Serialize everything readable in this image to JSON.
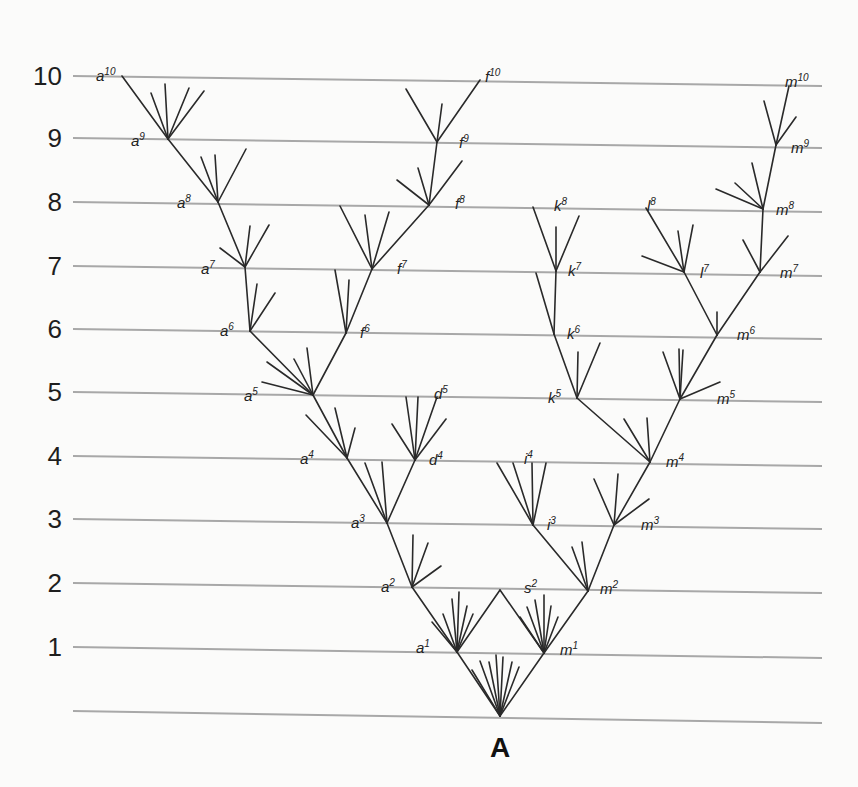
{
  "diagram": {
    "ancestor_label": "A",
    "generations": [
      {
        "label": "10",
        "y_left": 76,
        "y_right": 86
      },
      {
        "label": "9",
        "y_left": 138,
        "y_right": 148
      },
      {
        "label": "8",
        "y_left": 202,
        "y_right": 212
      },
      {
        "label": "7",
        "y_left": 266,
        "y_right": 276
      },
      {
        "label": "6",
        "y_left": 329,
        "y_right": 339
      },
      {
        "label": "5",
        "y_left": 392,
        "y_right": 402
      },
      {
        "label": "4",
        "y_left": 456,
        "y_right": 466
      },
      {
        "label": "3",
        "y_left": 519,
        "y_right": 529
      },
      {
        "label": "2",
        "y_left": 583,
        "y_right": 593
      },
      {
        "label": "1",
        "y_left": 647,
        "y_right": 658
      },
      {
        "label": "",
        "y_left": 711,
        "y_right": 723
      }
    ],
    "line_x_start": 73,
    "line_x_end": 822,
    "colors": {
      "background": "#fbfbfa",
      "generation_line": "#a8a8a8",
      "branch": "#2a2a2a",
      "text": "#1e1e1e"
    },
    "nodes": [
      {
        "id": "A",
        "x": 500,
        "y": 716
      },
      {
        "id": "a1",
        "x": 457,
        "y": 652,
        "base": "a",
        "sup": "1",
        "lx": 416,
        "ly": 641
      },
      {
        "id": "m1",
        "x": 544,
        "y": 653,
        "base": "m",
        "sup": "1",
        "lx": 560,
        "ly": 643
      },
      {
        "id": "s2",
        "x": 500,
        "y": 590,
        "base": "s",
        "sup": "2",
        "lx": 524,
        "ly": 581
      },
      {
        "id": "a2",
        "x": 412,
        "y": 587,
        "base": "a",
        "sup": "2",
        "lx": 381,
        "ly": 580
      },
      {
        "id": "m2",
        "x": 588,
        "y": 591,
        "base": "m",
        "sup": "2",
        "lx": 600,
        "ly": 582
      },
      {
        "id": "a3",
        "x": 387,
        "y": 523,
        "base": "a",
        "sup": "3",
        "lx": 351,
        "ly": 516
      },
      {
        "id": "i3",
        "x": 533,
        "y": 525,
        "base": "i",
        "sup": "3",
        "lx": 547,
        "ly": 518
      },
      {
        "id": "m3",
        "x": 614,
        "y": 525,
        "base": "m",
        "sup": "3",
        "lx": 641,
        "ly": 518
      },
      {
        "id": "a4",
        "x": 347,
        "y": 458,
        "base": "a",
        "sup": "4",
        "lx": 300,
        "ly": 452
      },
      {
        "id": "d4",
        "x": 415,
        "y": 460,
        "base": "d",
        "sup": "4",
        "lx": 429,
        "ly": 453
      },
      {
        "id": "i4",
        "x": 528,
        "y": 462,
        "base": "i",
        "sup": "4",
        "lx": 524,
        "ly": 452
      },
      {
        "id": "m4",
        "x": 650,
        "y": 462,
        "base": "m",
        "sup": "4",
        "lx": 666,
        "ly": 455
      },
      {
        "id": "a5",
        "x": 313,
        "y": 395,
        "base": "a",
        "sup": "5",
        "lx": 244,
        "ly": 389
      },
      {
        "id": "d5",
        "x": 437,
        "y": 397,
        "base": "d",
        "sup": "5",
        "lx": 434,
        "ly": 387
      },
      {
        "id": "k5",
        "x": 577,
        "y": 398,
        "base": "k",
        "sup": "5",
        "lx": 548,
        "ly": 391
      },
      {
        "id": "m5",
        "x": 680,
        "y": 399,
        "base": "m",
        "sup": "5",
        "lx": 717,
        "ly": 392
      },
      {
        "id": "a6",
        "x": 250,
        "y": 331,
        "base": "a",
        "sup": "6",
        "lx": 220,
        "ly": 324
      },
      {
        "id": "f6",
        "x": 346,
        "y": 333,
        "base": "f",
        "sup": "6",
        "lx": 360,
        "ly": 326
      },
      {
        "id": "k6",
        "x": 554,
        "y": 334,
        "base": "k",
        "sup": "6",
        "lx": 567,
        "ly": 327
      },
      {
        "id": "m6",
        "x": 717,
        "y": 335,
        "base": "m",
        "sup": "6",
        "lx": 737,
        "ly": 328
      },
      {
        "id": "a7",
        "x": 245,
        "y": 267,
        "base": "a",
        "sup": "7",
        "lx": 201,
        "ly": 262
      },
      {
        "id": "f7",
        "x": 372,
        "y": 269,
        "base": "f",
        "sup": "7",
        "lx": 397,
        "ly": 262
      },
      {
        "id": "k7",
        "x": 556,
        "y": 271,
        "base": "k",
        "sup": "7",
        "lx": 568,
        "ly": 264
      },
      {
        "id": "l7",
        "x": 684,
        "y": 272,
        "base": "l",
        "sup": "7",
        "lx": 700,
        "ly": 266
      },
      {
        "id": "m7",
        "x": 760,
        "y": 272,
        "base": "m",
        "sup": "7",
        "lx": 780,
        "ly": 266
      },
      {
        "id": "a8",
        "x": 218,
        "y": 202,
        "base": "a",
        "sup": "8",
        "lx": 177,
        "ly": 196
      },
      {
        "id": "f8",
        "x": 429,
        "y": 205,
        "base": "f",
        "sup": "8",
        "lx": 455,
        "ly": 197
      },
      {
        "id": "k8",
        "x": 533,
        "y": 207,
        "base": "k",
        "sup": "8",
        "lx": 554,
        "ly": 199
      },
      {
        "id": "l8",
        "x": 646,
        "y": 208,
        "base": "l",
        "sup": "8",
        "lx": 647,
        "ly": 199
      },
      {
        "id": "m8",
        "x": 763,
        "y": 209,
        "base": "m",
        "sup": "8",
        "lx": 776,
        "ly": 203
      },
      {
        "id": "a9",
        "x": 168,
        "y": 139,
        "base": "a",
        "sup": "9",
        "lx": 131,
        "ly": 134
      },
      {
        "id": "f9",
        "x": 437,
        "y": 142,
        "base": "f",
        "sup": "9",
        "lx": 459,
        "ly": 136
      },
      {
        "id": "m9",
        "x": 776,
        "y": 145,
        "base": "m",
        "sup": "9",
        "lx": 791,
        "ly": 141
      },
      {
        "id": "a10",
        "x": 122,
        "y": 76,
        "base": "a",
        "sup": "10",
        "lx": 96,
        "ly": 69
      },
      {
        "id": "f10",
        "x": 480,
        "y": 80,
        "base": "f",
        "sup": "10",
        "lx": 485,
        "ly": 70
      },
      {
        "id": "m10",
        "x": 789,
        "y": 86,
        "base": "m",
        "sup": "10",
        "lx": 785,
        "ly": 75
      }
    ],
    "edges": [
      [
        "A",
        "a1"
      ],
      [
        "A",
        "m1"
      ],
      [
        "a1",
        "a2"
      ],
      [
        "a1",
        "s2"
      ],
      [
        "m1",
        "s2"
      ],
      [
        "m1",
        "m2"
      ],
      [
        "a2",
        "a3"
      ],
      [
        "m2",
        "i3"
      ],
      [
        "m2",
        "m3"
      ],
      [
        "a3",
        "a4"
      ],
      [
        "a3",
        "d4"
      ],
      [
        "m3",
        "m4"
      ],
      [
        "a4",
        "a5"
      ],
      [
        "d4",
        "d5"
      ],
      [
        "m4",
        "k5"
      ],
      [
        "m4",
        "m5"
      ],
      [
        "a5",
        "a6"
      ],
      [
        "a5",
        "f6"
      ],
      [
        "k5",
        "k6"
      ],
      [
        "m5",
        "m6"
      ],
      [
        "a6",
        "a7"
      ],
      [
        "f6",
        "f7"
      ],
      [
        "k6",
        "k7"
      ],
      [
        "m6",
        "l7"
      ],
      [
        "m6",
        "m7"
      ],
      [
        "a7",
        "a8"
      ],
      [
        "f7",
        "f8"
      ],
      [
        "k7",
        "k8"
      ],
      [
        "l7",
        "l8"
      ],
      [
        "m7",
        "m8"
      ],
      [
        "a8",
        "a9"
      ],
      [
        "f8",
        "f9"
      ],
      [
        "m8",
        "m9"
      ],
      [
        "a9",
        "a10"
      ],
      [
        "f9",
        "f10"
      ],
      [
        "m9",
        "m10"
      ]
    ],
    "extinct_twigs": [
      {
        "from": "A",
        "to": [
          [
            472,
            670
          ],
          [
            480,
            661
          ],
          [
            489,
            662
          ],
          [
            496,
            655
          ],
          [
            503,
            657
          ],
          [
            512,
            662
          ],
          [
            519,
            667
          ]
        ]
      },
      {
        "from": "a1",
        "to": [
          [
            432,
            622
          ],
          [
            443,
            614
          ],
          [
            452,
            599
          ],
          [
            459,
            592
          ],
          [
            467,
            606
          ],
          [
            473,
            614
          ]
        ]
      },
      {
        "from": "m1",
        "to": [
          [
            520,
            617
          ],
          [
            527,
            607
          ],
          [
            535,
            600
          ],
          [
            544,
            595
          ],
          [
            551,
            606
          ],
          [
            558,
            617
          ]
        ]
      },
      {
        "from": "a2",
        "to": [
          [
            413,
            535
          ],
          [
            428,
            543
          ],
          [
            441,
            566
          ]
        ]
      },
      {
        "from": "m2",
        "to": [
          [
            572,
            547
          ],
          [
            582,
            542
          ]
        ]
      },
      {
        "from": "a3",
        "to": [
          [
            365,
            463
          ],
          [
            382,
            462
          ]
        ]
      },
      {
        "from": "i3",
        "to": [
          [
            497,
            463
          ],
          [
            513,
            463
          ],
          [
            532,
            463
          ],
          [
            546,
            463
          ]
        ]
      },
      {
        "from": "m3",
        "to": [
          [
            594,
            479
          ],
          [
            618,
            474
          ],
          [
            649,
            499
          ]
        ]
      },
      {
        "from": "a4",
        "to": [
          [
            306,
            415
          ],
          [
            335,
            408
          ],
          [
            355,
            428
          ]
        ]
      },
      {
        "from": "d4",
        "to": [
          [
            392,
            424
          ],
          [
            406,
            397
          ],
          [
            418,
            397
          ],
          [
            446,
            419
          ]
        ]
      },
      {
        "from": "m4",
        "to": [
          [
            624,
            419
          ],
          [
            647,
            418
          ]
        ]
      },
      {
        "from": "a5",
        "to": [
          [
            267,
            362
          ],
          [
            262,
            382
          ],
          [
            294,
            359
          ],
          [
            307,
            348
          ]
        ]
      },
      {
        "from": "k5",
        "to": [
          [
            578,
            352
          ],
          [
            600,
            343
          ]
        ]
      },
      {
        "from": "m5",
        "to": [
          [
            663,
            352
          ],
          [
            679,
            349
          ],
          [
            683,
            350
          ],
          [
            720,
            382
          ]
        ]
      },
      {
        "from": "m6",
        "to": [
          [
            717,
            312
          ]
        ]
      },
      {
        "from": "a6",
        "to": [
          [
            257,
            284
          ],
          [
            275,
            293
          ]
        ]
      },
      {
        "from": "f6",
        "to": [
          [
            335,
            270
          ],
          [
            349,
            280
          ]
        ]
      },
      {
        "from": "k6",
        "to": [
          [
            536,
            273
          ]
        ]
      },
      {
        "from": "a7",
        "to": [
          [
            220,
            248
          ],
          [
            250,
            226
          ],
          [
            269,
            225
          ]
        ]
      },
      {
        "from": "f7",
        "to": [
          [
            340,
            206
          ],
          [
            365,
            215
          ],
          [
            389,
            212
          ]
        ]
      },
      {
        "from": "k7",
        "to": [
          [
            556,
            227
          ],
          [
            579,
            216
          ]
        ]
      },
      {
        "from": "l7",
        "to": [
          [
            642,
            256
          ],
          [
            678,
            231
          ],
          [
            693,
            225
          ]
        ]
      },
      {
        "from": "m7",
        "to": [
          [
            743,
            240
          ],
          [
            788,
            236
          ]
        ]
      },
      {
        "from": "a8",
        "to": [
          [
            201,
            157
          ],
          [
            215,
            155
          ],
          [
            246,
            149
          ]
        ]
      },
      {
        "from": "f8",
        "to": [
          [
            397,
            180
          ],
          [
            418,
            168
          ],
          [
            462,
            161
          ]
        ]
      },
      {
        "from": "m8",
        "to": [
          [
            716,
            189
          ],
          [
            735,
            183
          ],
          [
            752,
            163
          ]
        ]
      },
      {
        "from": "a9",
        "to": [
          [
            151,
            93
          ],
          [
            165,
            84
          ],
          [
            189,
            88
          ],
          [
            204,
            91
          ]
        ]
      },
      {
        "from": "f9",
        "to": [
          [
            406,
            89
          ],
          [
            442,
            104
          ]
        ]
      },
      {
        "from": "m9",
        "to": [
          [
            764,
            101
          ],
          [
            796,
            117
          ]
        ]
      }
    ]
  }
}
